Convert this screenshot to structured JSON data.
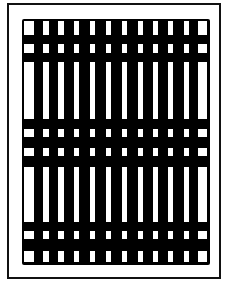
{
  "figure": {
    "type": "abstract-grid-pattern",
    "frame": {
      "left": 7,
      "top": 3,
      "width": 214,
      "height": 276,
      "border_color": "#111111"
    },
    "grid": {
      "left": 22,
      "top": 19,
      "width": 188,
      "height": 246,
      "background": "#000000",
      "cell_color": "#ffffff"
    },
    "columns": [
      {
        "x": 24,
        "w": 10
      },
      {
        "x": 43,
        "w": 6
      },
      {
        "x": 58,
        "w": 6
      },
      {
        "x": 74,
        "w": 5
      },
      {
        "x": 90,
        "w": 5
      },
      {
        "x": 106,
        "w": 5
      },
      {
        "x": 122,
        "w": 5
      },
      {
        "x": 138,
        "w": 5
      },
      {
        "x": 153,
        "w": 5
      },
      {
        "x": 168,
        "w": 5
      },
      {
        "x": 184,
        "w": 5
      },
      {
        "x": 198,
        "w": 9
      }
    ],
    "rows": [
      {
        "y": 21,
        "h": 14
      },
      {
        "y": 44,
        "h": 9
      },
      {
        "y": 62,
        "h": 57
      },
      {
        "y": 129,
        "h": 8
      },
      {
        "y": 148,
        "h": 8
      },
      {
        "y": 167,
        "h": 55
      },
      {
        "y": 231,
        "h": 8
      },
      {
        "y": 251,
        "h": 11
      }
    ]
  }
}
